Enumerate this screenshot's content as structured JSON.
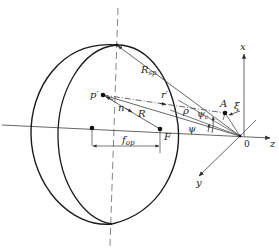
{
  "diagram": {
    "colors": {
      "line": "#555555",
      "lens": "#1a1a1a",
      "text": "#222222",
      "background": "#ffffff"
    },
    "labels": {
      "P_prime": "p′",
      "n": "n",
      "R": "R",
      "r_prime": "r′",
      "R_sp": "R",
      "R_sp_sub": "sp",
      "rho": "ρ",
      "psi_c": "ψ",
      "psi_c_sub": "c",
      "psi": "ψ",
      "A": "A",
      "xi": "ξ",
      "x_axis": "x",
      "y_axis": "y",
      "z_axis": "z",
      "origin": "0",
      "F": "F",
      "f_op": "f",
      "f_op_sub": "op"
    },
    "points": {
      "origin": [
        240,
        136
      ],
      "P_prime": [
        103,
        95
      ],
      "F": [
        160,
        129
      ],
      "A": [
        225,
        113
      ],
      "lens_center_dot": [
        92,
        128
      ],
      "lens_top": [
        117,
        45
      ]
    }
  }
}
